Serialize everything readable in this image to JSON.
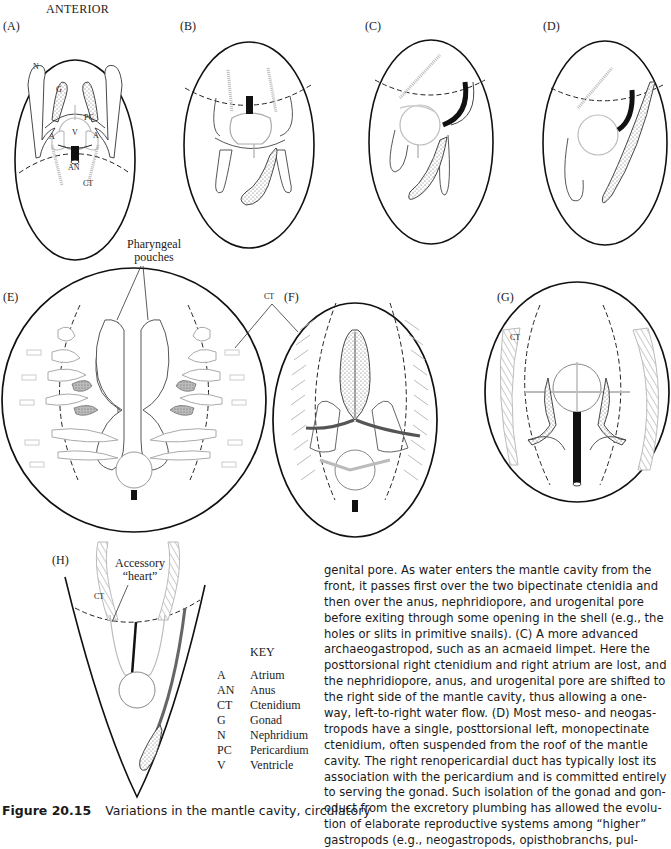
{
  "figure": {
    "orientation_label": "ANTERIOR",
    "panels": [
      {
        "id": "A",
        "label": "(A)"
      },
      {
        "id": "B",
        "label": "(B)"
      },
      {
        "id": "C",
        "label": "(C)"
      },
      {
        "id": "D",
        "label": "(D)"
      },
      {
        "id": "E",
        "label": "(E)"
      },
      {
        "id": "F",
        "label": "(F)"
      },
      {
        "id": "G",
        "label": "(G)"
      },
      {
        "id": "H",
        "label": "(H)"
      }
    ],
    "panel_a_labels": {
      "N": "N",
      "G": "G",
      "PC": "PC",
      "V": "V",
      "A_left": "A",
      "A_right": "A",
      "AN": "AN",
      "CT": "CT"
    },
    "callouts": {
      "pharyngeal_line1": "Pharyngeal",
      "pharyngeal_line2": "pouches",
      "ct_ef": "CT",
      "ct_g": "CT",
      "ct_h": "CT",
      "accessory_line1": "Accessory",
      "accessory_line2": "“heart”"
    },
    "key": {
      "title": "KEY",
      "entries": [
        {
          "abbr": "A",
          "term": "Atrium"
        },
        {
          "abbr": "AN",
          "term": "Anus"
        },
        {
          "abbr": "CT",
          "term": "Ctenidium"
        },
        {
          "abbr": "G",
          "term": "Gonad"
        },
        {
          "abbr": "N",
          "term": "Nephridium"
        },
        {
          "abbr": "PC",
          "term": "Pericardium"
        },
        {
          "abbr": "V",
          "term": "Ventricle"
        }
      ]
    },
    "caption": {
      "number": "Figure 20.15",
      "text": "Variations in the mantle cavity, circulatory"
    }
  },
  "body_text": {
    "lines": [
      "genital pore. As water enters the mantle cavity from the",
      "front, it passes first over the two bipectinate ctenidia and",
      "then over the anus, nephridiopore, and urogenital pore",
      "before exiting through some opening in the shell (e.g., the",
      "holes or slits in primitive snails). (C) A more advanced",
      "archaeogastropod, such as an acmaeid limpet. Here the",
      "posttorsional right ctenidium and right atrium are lost, and",
      "the nephridiopore, anus, and urogenital pore are shifted to",
      "the right side of the mantle cavity, thus allowing a one-",
      "way, left-to-right water flow. (D) Most meso- and neogas-",
      "tropods have a single, posttorsional left, monopectinate",
      "ctenidium, often suspended from the roof of the mantle",
      "cavity. The right renopericardial duct has typically lost its",
      "association with the pericardium and is committed entirely",
      "to serving the gonad. Such isolation of the gonad and gon-",
      "oduct from the excretory plumbing has allowed the evolu-",
      "tion of elaborate reproductive systems among “higher”",
      "gastropods (e.g., neogastropods, opisthobranchs, pul-"
    ]
  }
}
